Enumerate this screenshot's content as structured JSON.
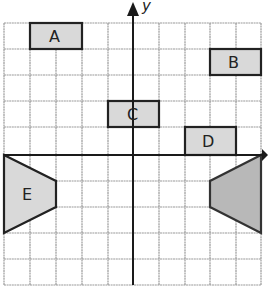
{
  "diagram": {
    "axes": {
      "x_label": "",
      "y_label": "y"
    },
    "grid": {
      "columns": 10,
      "rows": 10,
      "origin_col": 5,
      "origin_row": 5
    },
    "colors": {
      "grid": "#9a9a9a",
      "axis": "#1a1a1a",
      "shape_fill": "#d9d9d9",
      "shape_fill_dark": "#b8b8b8",
      "shape_stroke": "#222222"
    },
    "shapes": [
      {
        "label": "A",
        "type": "rectangle",
        "grid_coords": [
          [
            -4,
            5
          ],
          [
            -2,
            5
          ],
          [
            -2,
            4
          ],
          [
            -4,
            4
          ]
        ]
      },
      {
        "label": "B",
        "type": "rectangle",
        "grid_coords": [
          [
            3,
            4
          ],
          [
            5,
            4
          ],
          [
            5,
            3
          ],
          [
            3,
            3
          ]
        ]
      },
      {
        "label": "C",
        "type": "rectangle",
        "grid_coords": [
          [
            -1,
            2
          ],
          [
            1,
            2
          ],
          [
            1,
            1
          ],
          [
            -1,
            1
          ]
        ]
      },
      {
        "label": "D",
        "type": "rectangle",
        "grid_coords": [
          [
            2,
            1
          ],
          [
            4,
            1
          ],
          [
            4,
            0
          ],
          [
            2,
            0
          ]
        ]
      },
      {
        "label": "E",
        "type": "trapezoid",
        "grid_coords": [
          [
            -5,
            0
          ],
          [
            -3,
            -1
          ],
          [
            -3,
            -2
          ],
          [
            -5,
            -3
          ]
        ]
      },
      {
        "label": "",
        "type": "trapezoid",
        "grid_coords": [
          [
            5,
            0
          ],
          [
            3,
            -1
          ],
          [
            3,
            -2
          ],
          [
            5,
            -3
          ]
        ]
      }
    ]
  }
}
